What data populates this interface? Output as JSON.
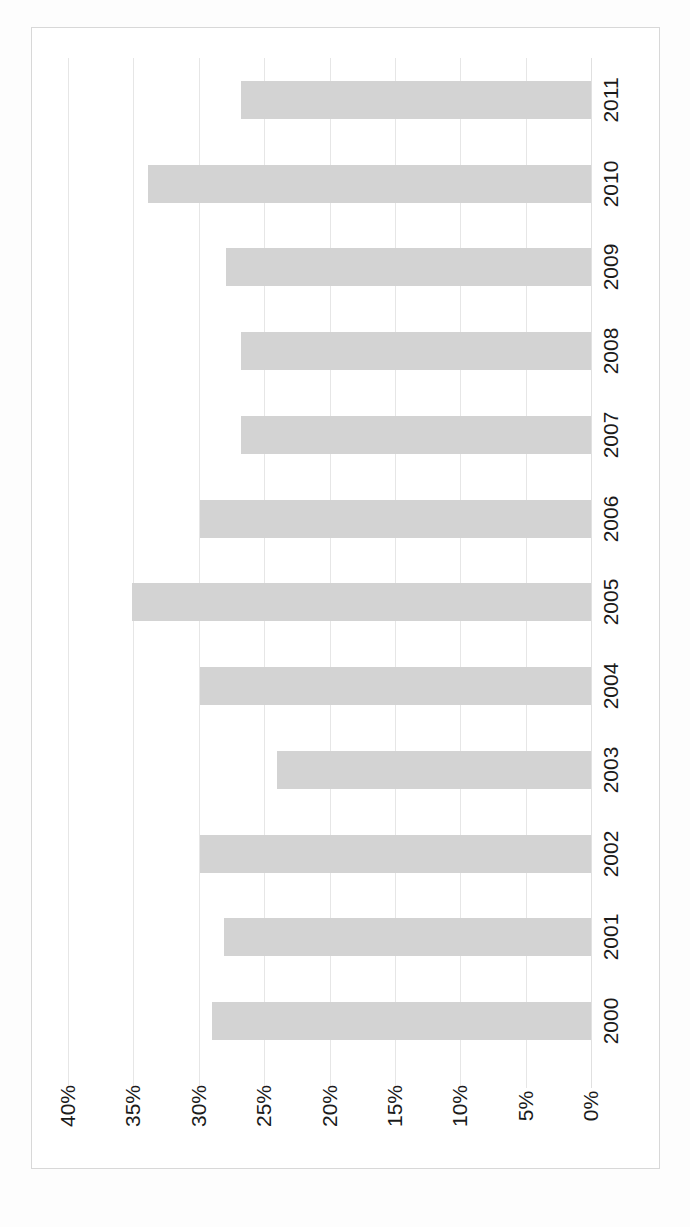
{
  "chart_data": {
    "type": "bar",
    "orientation": "horizontal-rotated",
    "title": "",
    "subtitle": "",
    "xlabel": "",
    "ylabel": "",
    "categories": [
      "2000",
      "2001",
      "2002",
      "2003",
      "2004",
      "2005",
      "2006",
      "2007",
      "2008",
      "2009",
      "2010",
      "2011"
    ],
    "values": [
      29.0,
      28.1,
      29.9,
      24.0,
      29.9,
      35.1,
      29.9,
      26.8,
      26.8,
      27.9,
      33.9,
      26.8
    ],
    "value_tick_labels": [
      "40%",
      "35%",
      "30%",
      "25%",
      "20%",
      "15%",
      "10%",
      "5%",
      "0%"
    ],
    "value_ticks": [
      40,
      35,
      30,
      25,
      20,
      15,
      10,
      5,
      0
    ],
    "vlim": [
      0,
      40
    ],
    "grid": true,
    "legend": false,
    "legend_position": "none",
    "series": [
      {
        "name": "Series 1",
        "color": "#d3d3d3",
        "values": [
          29.0,
          28.1,
          29.9,
          24.0,
          29.9,
          35.1,
          29.9,
          26.8,
          26.8,
          27.9,
          33.9,
          26.8
        ]
      }
    ],
    "annotations": []
  },
  "axes": {
    "value_axis_name": "percentage-axis",
    "category_axis_name": "year-axis"
  },
  "style": {
    "bar_color": "#d3d3d3",
    "grid_color": "#e6e6e6",
    "border_color": "#d8d8d8",
    "text_color": "#1b1b1b",
    "background": "#ffffff"
  }
}
